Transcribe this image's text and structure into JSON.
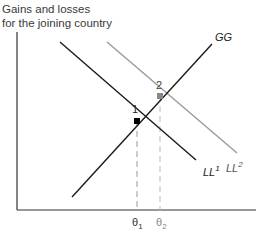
{
  "diagram": {
    "y_axis_label_line1": "Gains and losses",
    "y_axis_label_line2": "for the joining country",
    "curves": [
      {
        "id": "GG",
        "label": "GG",
        "color": "#1a1a1a"
      },
      {
        "id": "LL1",
        "label": "LL",
        "superscript": "1",
        "color": "#1a1a1a"
      },
      {
        "id": "LL2",
        "label": "LL",
        "superscript": "2",
        "color": "#9a9a9a"
      }
    ],
    "points": [
      {
        "id": "1",
        "label": "1",
        "color": "#000000"
      },
      {
        "id": "2",
        "label": "2",
        "color": "#8a8a8a"
      }
    ],
    "x_ticks": [
      {
        "label": "θ",
        "subscript": "1",
        "color": "#333333"
      },
      {
        "label": "θ",
        "subscript": "2",
        "color": "#8a8a8a"
      }
    ]
  }
}
